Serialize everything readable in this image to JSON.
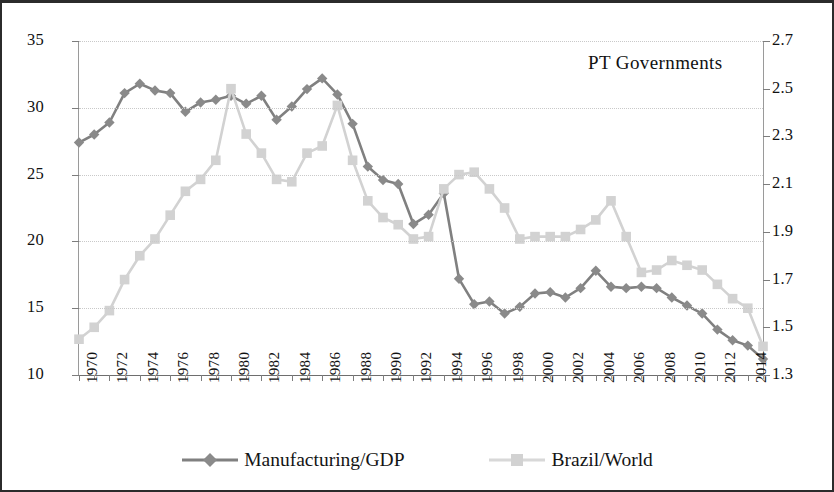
{
  "annotation": {
    "text": "PT  Governments"
  },
  "legend": {
    "items": [
      {
        "label": "Manufacturing/GDP",
        "marker": "diamond-marker-icon",
        "color": "#808080"
      },
      {
        "label": "Brazil/World",
        "marker": "square-marker-icon",
        "color": "#d2d2d2"
      }
    ]
  },
  "axes": {
    "left_ticks": [
      "10",
      "15",
      "20",
      "25",
      "30",
      "35"
    ],
    "right_ticks": [
      "1.3",
      "1.5",
      "1.7",
      "1.9",
      "2.1",
      "2.3",
      "2.5",
      "2.7"
    ],
    "x_ticks": [
      "1970",
      "1972",
      "1974",
      "1976",
      "1978",
      "1980",
      "1982",
      "1984",
      "1986",
      "1988",
      "1990",
      "1992",
      "1994",
      "1996",
      "1998",
      "2000",
      "2002",
      "2004",
      "2006",
      "2008",
      "2010",
      "2012",
      "2014"
    ]
  },
  "chart_data": {
    "type": "line",
    "title": "",
    "subtitle": "",
    "xlabel": "",
    "ylabel": "",
    "y2label": "",
    "ylim": [
      10,
      35
    ],
    "y2lim": [
      1.3,
      2.7
    ],
    "xlim": [
      1970,
      2015
    ],
    "grid": true,
    "legend_position": "bottom-center",
    "annotations": [
      {
        "text": "PT  Governments",
        "x": 2009,
        "y": 33.4
      }
    ],
    "x": [
      1970,
      1971,
      1972,
      1973,
      1974,
      1975,
      1976,
      1977,
      1978,
      1979,
      1980,
      1981,
      1982,
      1983,
      1984,
      1985,
      1986,
      1987,
      1988,
      1989,
      1990,
      1991,
      1992,
      1993,
      1994,
      1995,
      1996,
      1997,
      1998,
      1999,
      2000,
      2001,
      2002,
      2003,
      2004,
      2005,
      2006,
      2007,
      2008,
      2009,
      2010,
      2011,
      2012,
      2013,
      2014,
      2015
    ],
    "series": [
      {
        "name": "Manufacturing/GDP",
        "axis": "left",
        "color": "#808080",
        "marker": "diamond",
        "values": [
          27.4,
          28.0,
          28.9,
          31.1,
          31.8,
          31.3,
          31.1,
          29.7,
          30.4,
          30.6,
          30.9,
          30.3,
          30.9,
          29.1,
          30.1,
          31.4,
          32.2,
          31.0,
          28.8,
          25.6,
          24.6,
          24.3,
          21.3,
          22.0,
          23.6,
          17.2,
          15.3,
          15.5,
          14.6,
          15.1,
          16.1,
          16.2,
          15.8,
          16.5,
          17.8,
          16.6,
          16.5,
          16.6,
          16.5,
          15.8,
          15.2,
          14.6,
          13.4,
          12.6,
          12.2,
          11.2
        ]
      },
      {
        "name": "Brazil/World",
        "axis": "right",
        "color": "#d2d2d2",
        "marker": "square",
        "values": [
          1.45,
          1.5,
          1.57,
          1.7,
          1.8,
          1.87,
          1.97,
          2.07,
          2.12,
          2.2,
          2.5,
          2.31,
          2.23,
          2.12,
          2.11,
          2.23,
          2.26,
          2.43,
          2.2,
          2.03,
          1.96,
          1.93,
          1.87,
          1.88,
          2.08,
          2.14,
          2.15,
          2.08,
          2.0,
          1.87,
          1.88,
          1.88,
          1.88,
          1.91,
          1.95,
          2.03,
          1.88,
          1.73,
          1.74,
          1.78,
          1.76,
          1.74,
          1.68,
          1.62,
          1.58,
          1.42
        ]
      }
    ]
  }
}
